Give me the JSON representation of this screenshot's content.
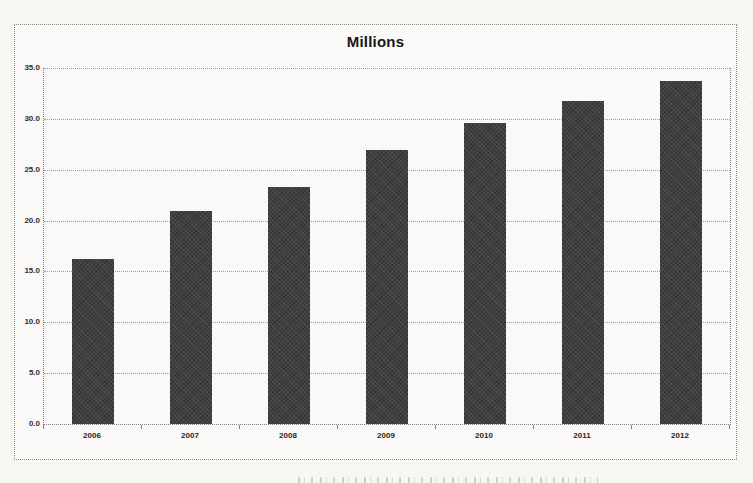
{
  "page": {
    "background": "#f8f7f4",
    "bottom_edge_note": "illegible cropped caption text cut off by image edge"
  },
  "chart": {
    "title": "Millions",
    "bar_color": "#3f3f3f",
    "grid_color": "#9b9b9b",
    "axis_color": "#7d7d7d",
    "frame_color": "#8a8a8a",
    "y_ticks": [
      "35.0",
      "30.0",
      "25.0",
      "20.0",
      "15.0",
      "10.0",
      "5.0",
      "0.0"
    ]
  },
  "chart_data": {
    "type": "bar",
    "title": "Millions",
    "categories": [
      "2006",
      "2007",
      "2008",
      "2009",
      "2010",
      "2011",
      "2012"
    ],
    "values": [
      16.2,
      20.9,
      23.3,
      26.9,
      29.6,
      31.8,
      33.7
    ],
    "xlabel": "",
    "ylabel": "Millions",
    "ylim": [
      0,
      35
    ],
    "ytick_step": 5,
    "grid": true,
    "legend_position": "none",
    "series_name": "Millions"
  }
}
